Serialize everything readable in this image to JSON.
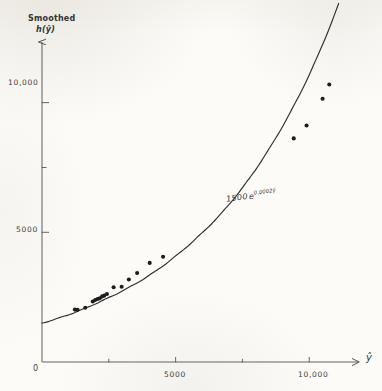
{
  "chart_data": {
    "type": "scatter",
    "title": "",
    "subtitle": "",
    "ylabel_line1": "Smoothed",
    "ylabel_line2": "h(ŷ)",
    "xlabel": "ŷ",
    "xlim": [
      0,
      11600
    ],
    "ylim": [
      0,
      12800
    ],
    "grid": false,
    "legend": null,
    "x_ticks": [
      {
        "value": 0,
        "label": "0",
        "major": true
      },
      {
        "value": 2500,
        "label": "",
        "major": false
      },
      {
        "value": 5000,
        "label": "5000",
        "major": true
      },
      {
        "value": 7500,
        "label": "",
        "major": false
      },
      {
        "value": 10000,
        "label": "10,000",
        "major": true
      }
    ],
    "y_ticks": [
      {
        "value": 0,
        "label": "0",
        "major": true
      },
      {
        "value": 5000,
        "label": "5000",
        "major": true
      },
      {
        "value": 7500,
        "label": "",
        "major": false
      },
      {
        "value": 10000,
        "label": "10,000",
        "major": true
      }
    ],
    "annotations": [
      {
        "text": "1500 e^{0.0002ŷ}",
        "coefficient": "1500",
        "base": "e",
        "exponent": "0.0002ŷ",
        "x": 6400,
        "y": 6050
      }
    ],
    "series": [
      {
        "name": "fitted curve",
        "type": "line",
        "equation": "1500 e^{0.0002ŷ}",
        "amplitude": 1500,
        "rate": 0.0002,
        "color": "#2e2e2e",
        "x_start": 0,
        "x_end": 11100
      },
      {
        "name": "observations",
        "type": "scatter",
        "marker": "filled-circle",
        "color": "#1c1c1c",
        "points": [
          {
            "x": 1230,
            "y": 2020
          },
          {
            "x": 1330,
            "y": 2010
          },
          {
            "x": 1620,
            "y": 2090
          },
          {
            "x": 1900,
            "y": 2330
          },
          {
            "x": 1990,
            "y": 2390
          },
          {
            "x": 2080,
            "y": 2430
          },
          {
            "x": 2160,
            "y": 2460
          },
          {
            "x": 2250,
            "y": 2530
          },
          {
            "x": 2330,
            "y": 2560
          },
          {
            "x": 2430,
            "y": 2620
          },
          {
            "x": 2680,
            "y": 2880
          },
          {
            "x": 2980,
            "y": 2900
          },
          {
            "x": 3250,
            "y": 3180
          },
          {
            "x": 3560,
            "y": 3430
          },
          {
            "x": 4030,
            "y": 3820
          },
          {
            "x": 4530,
            "y": 4060
          },
          {
            "x": 9420,
            "y": 8620
          },
          {
            "x": 9900,
            "y": 9120
          },
          {
            "x": 10500,
            "y": 10150
          },
          {
            "x": 10750,
            "y": 10700
          }
        ]
      }
    ]
  }
}
